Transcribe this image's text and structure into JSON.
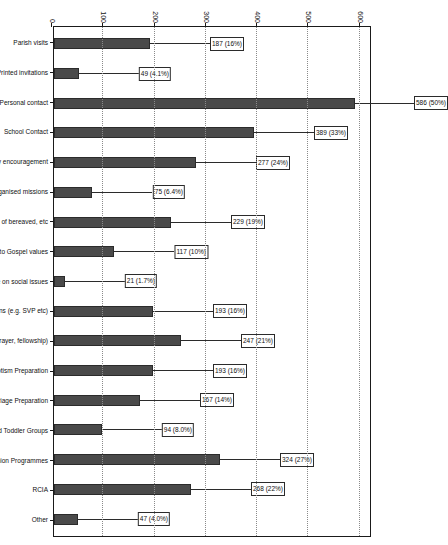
{
  "chart_data": {
    "type": "bar",
    "title": "",
    "subtitle": "",
    "xlabel": "",
    "ylabel": "",
    "ylim": [
      0,
      620
    ],
    "yticks": [
      0,
      100,
      200,
      300,
      400,
      500,
      600
    ],
    "grid": true,
    "legend": "none",
    "orientation": "vertical-bars-on-rotated-page",
    "bar_color": "#4a4a4a",
    "categories": [
      "Parish visits",
      "Printed invitations",
      "Personal contact",
      "School Contact",
      "Family encouragement",
      "Organised missions",
      "Care of bereaved, etc",
      "Witness to Gospel values",
      "High public profile on social issues",
      "The work of parish organisations  (e.g. SVP etc)",
      "Small groups (prayer, fellowship)",
      "Baptism Preparation",
      "Marriage Preparation",
      "Mother and Toddler Groups",
      "First Communion Programmes",
      "RCIA",
      "Other"
    ],
    "values": [
      187,
      49,
      586,
      389,
      277,
      75,
      229,
      117,
      21,
      193,
      247,
      193,
      167,
      94,
      324,
      268,
      47
    ],
    "percent_labels": [
      "16%",
      "4.1%",
      "50%",
      "33%",
      "24%",
      "6.4%",
      "19%",
      "10%",
      "1.7%",
      "16%",
      "21%",
      "16%",
      "14%",
      "8.0%",
      "27%",
      "22%",
      "4.0%"
    ],
    "data_labels": [
      "187 (16%)",
      "49 (4.1%)",
      "586 (50%)",
      "389 (33%)",
      "277 (24%)",
      "75 (6.4%)",
      "229 (19%)",
      "117 (10%)",
      "21 (1.7%)",
      "193 (16%)",
      "247 (21%)",
      "193 (16%)",
      "167 (14%)",
      "94 (8.0%)",
      "324 (27%)",
      "268 (22%)",
      "47 (4.0%)"
    ]
  }
}
